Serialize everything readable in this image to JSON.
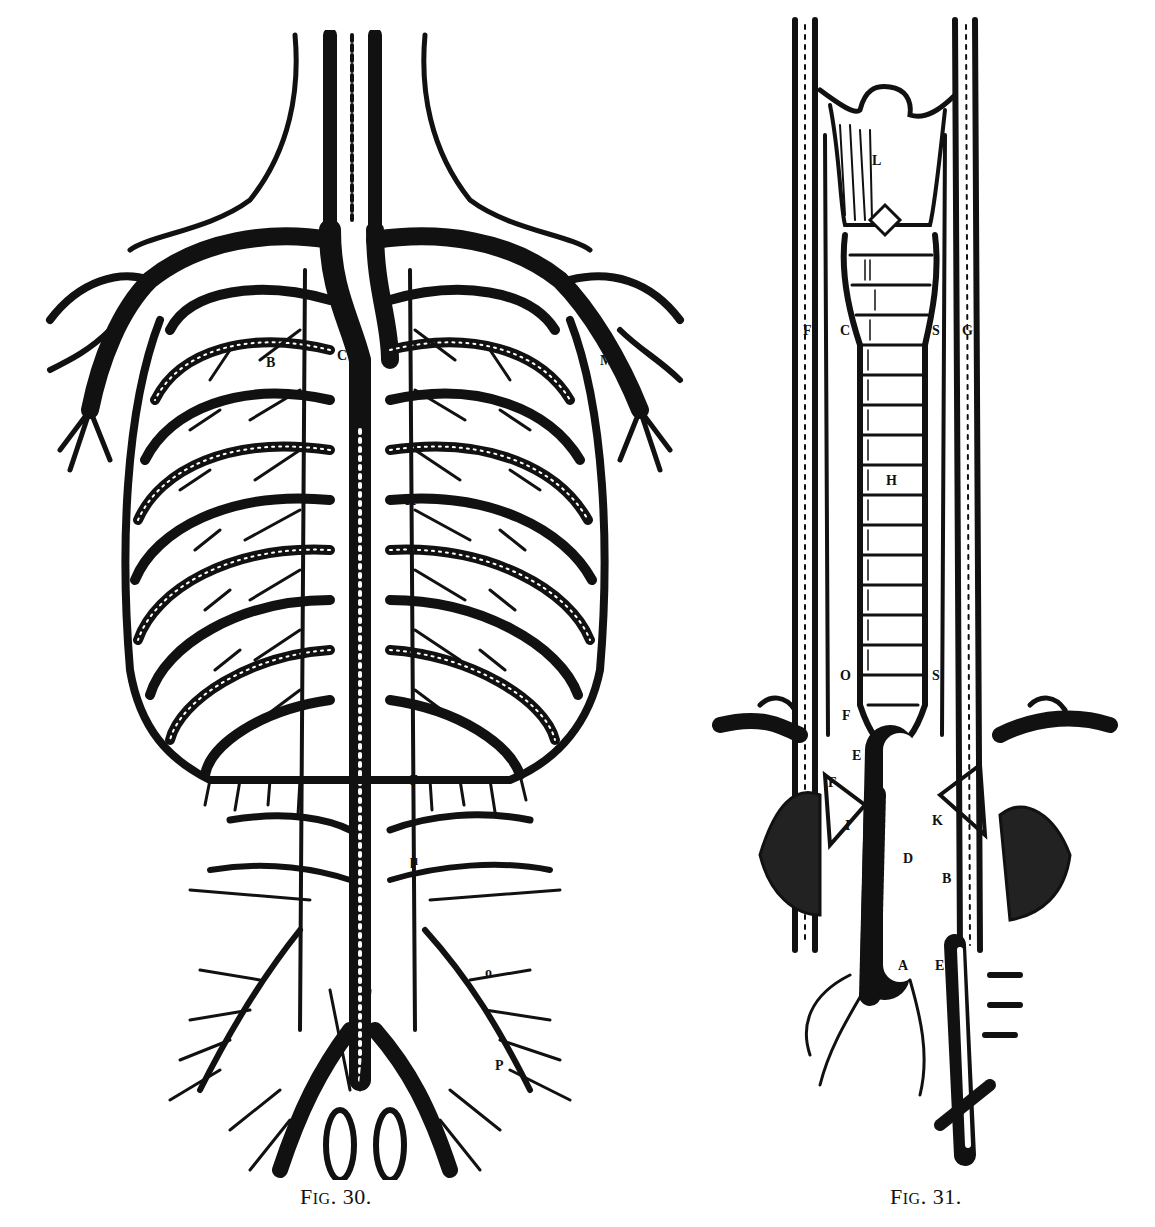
{
  "page": {
    "top_text_fragment": "...cropped line of body text..."
  },
  "figures": [
    {
      "id": "fig30",
      "caption_prefix": "F",
      "caption_smallcaps": "IG",
      "caption_number": ". 30.",
      "description": "Woodcut of the thoracic and abdominal venous system with rib cage",
      "labels": [
        "V",
        "C",
        "B",
        "K",
        "μ",
        "M",
        "o",
        "P"
      ]
    },
    {
      "id": "fig31",
      "caption_prefix": "F",
      "caption_smallcaps": "IG",
      "caption_number": ". 31.",
      "description": "Woodcut of the trachea, larynx, aorta and associated vessels",
      "labels": [
        "L",
        "F",
        "C",
        "S",
        "G",
        "H",
        "O",
        "E",
        "I",
        "D",
        "K",
        "B",
        "A"
      ]
    }
  ],
  "colors": {
    "ink": "#111111",
    "paper": "#ffffff"
  }
}
